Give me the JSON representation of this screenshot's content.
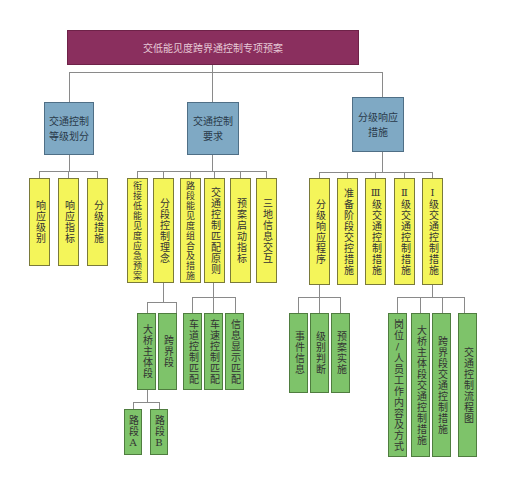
{
  "diagram": {
    "title": "交低能见度跨界通控制专项预案",
    "colors": {
      "root": "#8a2f5e",
      "level1": "#7fa9c4",
      "level2": "#f4f55a",
      "level3": "#7ec36a",
      "line": "#8a8a8a"
    },
    "level1": [
      {
        "label": "交通控制等级划分"
      },
      {
        "label": "交通控制要求"
      },
      {
        "label": "分级响应措施"
      }
    ],
    "grading": [
      {
        "label": "响应级别"
      },
      {
        "label": "响应指标"
      },
      {
        "label": "分级措施"
      }
    ],
    "requirements": [
      {
        "label": "衔接低能见度应急预案"
      },
      {
        "label": "分段控制理念"
      },
      {
        "label": "路段能见度组合及措施"
      },
      {
        "label": "交通控制匹配原则"
      },
      {
        "label": "预案启动指标"
      },
      {
        "label": "三地信息交互"
      }
    ],
    "segment_concept": [
      {
        "label": "大桥主体段"
      },
      {
        "label": "跨界段"
      }
    ],
    "bridge_segments": [
      {
        "label": "路段A"
      },
      {
        "label": "路段B"
      }
    ],
    "matching_principles": [
      {
        "label": "车道控制匹配"
      },
      {
        "label": "车速控制匹配"
      },
      {
        "label": "信息显示匹配"
      }
    ],
    "responses": [
      {
        "label": "分级响应程序"
      },
      {
        "label": "准备阶段交控措施"
      },
      {
        "label": "Ⅲ级交通控制措施"
      },
      {
        "label": "Ⅱ级交通控制措施"
      },
      {
        "label": "Ⅰ级交通控制措施"
      }
    ],
    "procedure": [
      {
        "label": "事件信息"
      },
      {
        "label": "级别判断"
      },
      {
        "label": "预案实施"
      }
    ],
    "level_one_measures": [
      {
        "label": "岗位/人员工作内容及方式"
      },
      {
        "label": "大桥主体段交通控制措施"
      },
      {
        "label": "跨界段交通控制措施"
      },
      {
        "label": "交通控制流程图"
      }
    ]
  }
}
